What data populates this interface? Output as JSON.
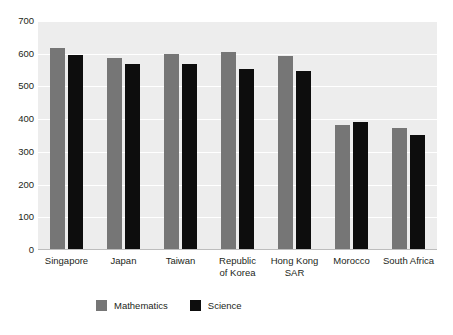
{
  "chart_data": {
    "type": "bar",
    "title": "",
    "subtitle": "",
    "xlabel": "",
    "ylabel": "",
    "ylim": [
      0,
      700
    ],
    "yticks": [
      0,
      100,
      200,
      300,
      400,
      500,
      600,
      700
    ],
    "ytick_labels": [
      "0",
      "100",
      "200",
      "300",
      "400",
      "500",
      "600",
      "700"
    ],
    "grid": true,
    "grid_axis": "y",
    "legend_position": "bottom-left",
    "orientation": "vertical",
    "grouping": "grouped",
    "categories": [
      "Singapore",
      "Japan",
      "Taiwan",
      "Republic\nof Korea",
      "Hong Kong\nSAR",
      "Morocco",
      "South Africa"
    ],
    "series": [
      {
        "name": "Mathematics",
        "color": "#767676",
        "values": [
          618,
          588,
          598,
          605,
          594,
          382,
          372
        ]
      },
      {
        "name": "Science",
        "color": "#0d0d0d",
        "values": [
          595,
          570,
          570,
          553,
          546,
          390,
          352
        ]
      }
    ],
    "colors": {
      "plot_background": "#ededed",
      "page_background": "#ffffff",
      "gridline": "#ffffff",
      "axis_line": "#bdbdbd",
      "text": "#231f20"
    }
  },
  "legend": {
    "items": [
      {
        "label": "Mathematics",
        "swatch_class": "math"
      },
      {
        "label": "Science",
        "swatch_class": "sci"
      }
    ]
  }
}
